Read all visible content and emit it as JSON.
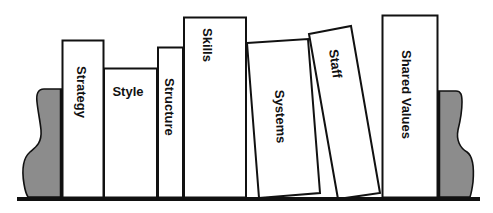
{
  "diagram": {
    "title": "",
    "colors": {
      "background": "#ffffff",
      "outline": "#111111",
      "book_fill": "#ffffff",
      "bookend_fill": "#8c8c8c",
      "shelf": "#111111"
    },
    "books": [
      {
        "id": "strategy",
        "label": "Strategy",
        "orientation": "vertical"
      },
      {
        "id": "style",
        "label": "Style",
        "orientation": "horizontal"
      },
      {
        "id": "structure",
        "label": "Structure",
        "orientation": "vertical"
      },
      {
        "id": "skills",
        "label": "Skills",
        "orientation": "vertical"
      },
      {
        "id": "systems",
        "label": "Systems",
        "orientation": "vertical-tilted"
      },
      {
        "id": "staff",
        "label": "Staff",
        "orientation": "vertical-tilted"
      },
      {
        "id": "shared_values",
        "label": "Shared Values",
        "orientation": "vertical"
      }
    ],
    "bookends": [
      {
        "id": "left",
        "side": "left"
      },
      {
        "id": "right",
        "side": "right"
      }
    ]
  }
}
